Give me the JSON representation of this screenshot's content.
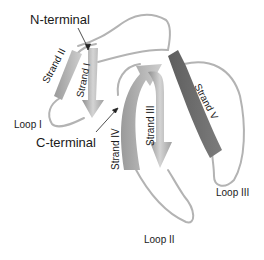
{
  "diagram": {
    "type": "protein-ribbon",
    "labels": {
      "n_terminal": "N-terminal",
      "c_terminal": "C-terminal",
      "strand_1": "Strand I",
      "strand_2": "Strand II",
      "strand_3": "Strand III",
      "strand_4": "Strand IV",
      "strand_5": "Strand V",
      "loop_1": "Loop I",
      "loop_2": "Loop II",
      "loop_3": "Loop III"
    },
    "colors": {
      "background": "#ffffff",
      "strand_light": "#c8c8c8",
      "strand_mid": "#a6a6a6",
      "strand_dark": "#6e6e6e",
      "coil": "#b0b0b0",
      "arrow": "#222222"
    }
  }
}
